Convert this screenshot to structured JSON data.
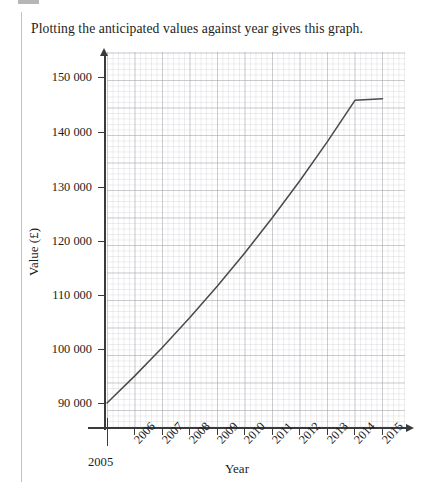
{
  "document": {
    "prompt": "Plotting the anticipated values against year gives this graph."
  },
  "chart_data": {
    "type": "line",
    "title": "",
    "xlabel": "Year",
    "ylabel": "Value (£)",
    "grid": "major-and-minor",
    "legend": "none",
    "xlim": [
      2005,
      2015.8
    ],
    "ylim": [
      85000,
      152800
    ],
    "x_tick_labels": [
      "2005",
      "2006",
      "2007",
      "2008",
      "2009",
      "2010",
      "2011",
      "2012",
      "2013",
      "2014",
      "2015"
    ],
    "y_tick_labels": [
      "90 000",
      "100 000",
      "110 000",
      "120 000",
      "130 000",
      "140 000",
      "150 000"
    ],
    "y_tick_values": [
      90000,
      100000,
      110000,
      120000,
      130000,
      140000,
      150000
    ],
    "series": [
      {
        "name": "Anticipated value",
        "x": [
          2005,
          2006,
          2007,
          2008,
          2009,
          2010,
          2011,
          2012,
          2013,
          2014,
          2015
        ],
        "values": [
          90000,
          94950,
          100168,
          105677,
          111489,
          117621,
          124090,
          130915,
          138115,
          145711,
          146000
        ]
      }
    ]
  }
}
